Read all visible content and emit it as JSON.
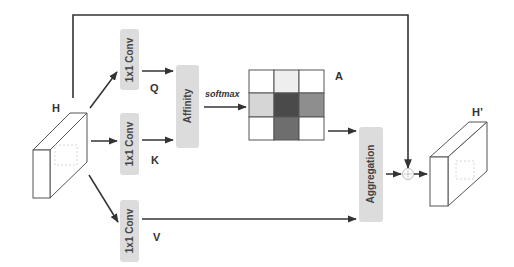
{
  "diagram": {
    "input": {
      "label": "H"
    },
    "output": {
      "label": "H’"
    },
    "convs": [
      {
        "label": "1x1 Conv",
        "output": "Q"
      },
      {
        "label": "1x1 Conv",
        "output": "K"
      },
      {
        "label": "1x1 Conv",
        "output": "V"
      }
    ],
    "affinity": {
      "label": "Affinity"
    },
    "softmax": {
      "label": "softmax"
    },
    "attention_map": {
      "label": "A",
      "grid": [
        [
          "#ffffff",
          "#eeeeee",
          "#ffffff"
        ],
        [
          "#d6d6d6",
          "#4a4a4a",
          "#8e8e8e"
        ],
        [
          "#ffffff",
          "#6e6e6e",
          "#ffffff"
        ]
      ]
    },
    "aggregation": {
      "label": "Aggregation"
    },
    "sum": {
      "symbol": "+"
    },
    "colors": {
      "line": "#333333",
      "box_fill": "#dcdcdc",
      "grid_border": "#555555"
    }
  }
}
